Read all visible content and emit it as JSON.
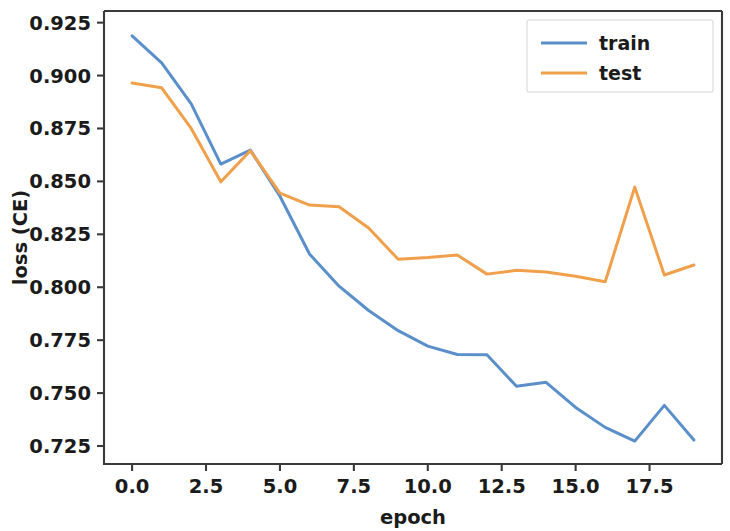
{
  "chart_data": {
    "type": "line",
    "title": "",
    "xlabel": "epoch",
    "ylabel": "loss (CE)",
    "x": [
      0,
      1,
      2,
      3,
      4,
      5,
      6,
      7,
      8,
      9,
      10,
      11,
      12,
      13,
      14,
      15,
      16,
      17,
      18,
      19
    ],
    "xlim": [
      -0.95,
      19.95
    ],
    "ylim": [
      0.7165,
      0.9305
    ],
    "xticks": [
      0.0,
      2.5,
      5.0,
      7.5,
      10.0,
      12.5,
      15.0,
      17.5
    ],
    "xtick_labels": [
      "0.0",
      "2.5",
      "5.0",
      "7.5",
      "10.0",
      "12.5",
      "15.0",
      "17.5"
    ],
    "yticks": [
      0.725,
      0.75,
      0.775,
      0.8,
      0.825,
      0.85,
      0.875,
      0.9,
      0.925
    ],
    "ytick_labels": [
      "0.725",
      "0.750",
      "0.775",
      "0.800",
      "0.825",
      "0.850",
      "0.875",
      "0.900",
      "0.925"
    ],
    "grid": false,
    "legend_position": "upper right",
    "series": [
      {
        "name": "train",
        "color": "#5b8fc9",
        "values": [
          0.9188,
          0.906,
          0.8866,
          0.8582,
          0.8648,
          0.843,
          0.8157,
          0.8005,
          0.789,
          0.7795,
          0.7722,
          0.7682,
          0.7681,
          0.7532,
          0.7551,
          0.7432,
          0.7338,
          0.7273,
          0.7442,
          0.7278
        ]
      },
      {
        "name": "test",
        "color": "#f0a04b",
        "values": [
          0.8965,
          0.8942,
          0.875,
          0.8498,
          0.8645,
          0.8445,
          0.8388,
          0.838,
          0.828,
          0.8132,
          0.814,
          0.8152,
          0.8062,
          0.808,
          0.8072,
          0.8052,
          0.8026,
          0.8473,
          0.8058,
          0.8105
        ]
      }
    ],
    "legend_entries": [
      {
        "label": "train",
        "color": "#5b8fc9"
      },
      {
        "label": "test",
        "color": "#f0a04b"
      }
    ]
  },
  "axes": {
    "x_axis_title": "epoch",
    "y_axis_title": "loss (CE)"
  }
}
